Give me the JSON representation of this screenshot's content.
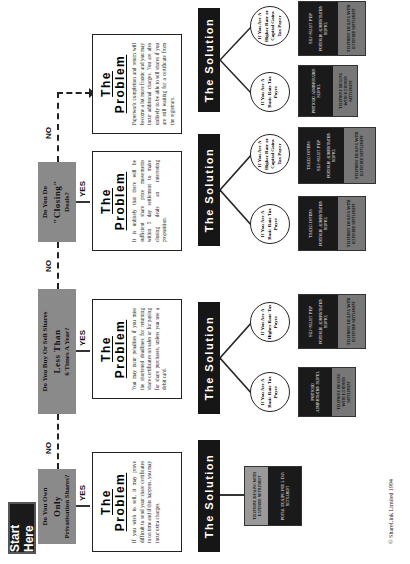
{
  "start": {
    "label": "Start Here"
  },
  "questions": [
    {
      "line1": "Do You Own",
      "big": "Only",
      "line3": "Privatisation Shares?"
    },
    {
      "line1": "Do You Buy Or Sell Shares",
      "big": "Less Than",
      "line3": "6 Times A Year?"
    },
    {
      "line1": "Do You Do",
      "big": "\"Closing\"",
      "line3": "Deals?"
    }
  ],
  "labels": {
    "yes": "YES",
    "no": "NO"
  },
  "problems": [
    {
      "title": "The Problem",
      "text": "If you wish to sell, it may prove difficult to send your share certificates in on time and if this happens, you may incur extra charges."
    },
    {
      "title": "The Problem",
      "text": "You may incur penalties if you miss the shortened deadlines for returning share certificates on sales or for paying for share purchases, unless you use a debit card."
    },
    {
      "title": "The Problem",
      "text": "It is unlikely that there will be sufficient share price movements within 5 day settlement to make closing deals an interesting proposition."
    },
    {
      "title": "The Problem",
      "text": "Paperwork completion and return will become a lot more frantic and you may incur additional charges. You are also unlikely to be able to sell shares if you are still waiting for a certificate from the registrars."
    }
  ],
  "solution_title": "The Solution",
  "solutions": [
    {
      "type": "single",
      "dark": [
        "Postal Dealing For 5 Day Settlement"
      ],
      "grey": [
        "Telephone Dealing With Extended Settlement"
      ]
    },
    {
      "type": "split",
      "branches": [
        {
          "circle": "If You Are A Basic Rate Tax Payer",
          "dark": [
            "Portfolio Administration Service"
          ],
          "grey": [
            "Telephone Dealing With Extended Settlement"
          ]
        },
        {
          "circle": "If You Are A Higher Rate Tax Payer",
          "dark": [
            "Self-Select PEP",
            "Portfolio Administration Service"
          ],
          "grey": [
            "Telephone Dealing With Extended Settlement"
          ]
        }
      ]
    },
    {
      "type": "split",
      "branches": [
        {
          "circle": "If You Are A Basic Rate Tax Payer",
          "dark": [
            "Traded Options",
            "Portfolio Administration Service"
          ],
          "grey": [
            "Telephone Dealing With Extended Settlement"
          ]
        },
        {
          "circle": "If You Are A Higher Rate or Capital Gains Tax Payer",
          "dark": [
            "Traded Options",
            "Self-Select PEP",
            "Portfolio Administration Service"
          ],
          "grey": [
            "Telephone Dealing With Extended Settlement"
          ]
        }
      ]
    },
    {
      "type": "split",
      "branches": [
        {
          "circle": "If You Are A Basic Rate Tax Payer",
          "dark": [
            "Portfolio Administration Service"
          ],
          "grey": [
            "Telephone Dealing With Extended Settlement"
          ]
        },
        {
          "circle": "If You Are A Higher Rate or Capital Gains Tax Payer",
          "dark": [
            "Self-Select PEP",
            "Portfolio Administration Service"
          ],
          "grey": [
            "Telephone Dealing With Extended Settlement"
          ]
        }
      ]
    }
  ],
  "copyright": "© ShareLink Limited 1994"
}
